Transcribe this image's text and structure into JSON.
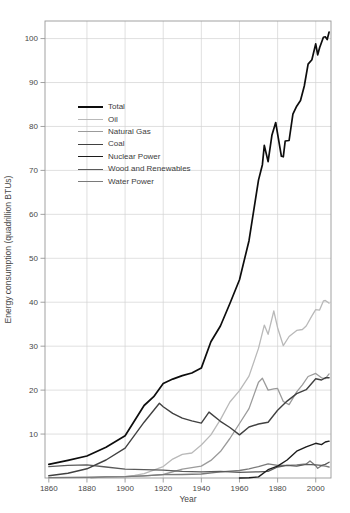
{
  "figure": {
    "background": "#ffffff",
    "text_color": "#474747",
    "grid_color": "#d2d2d2",
    "axis_color": "#979797"
  },
  "chart_data": {
    "type": "line",
    "title": "",
    "xlabel": "Year",
    "ylabel": "Energy consumption (quadrillion BTUs)",
    "xlim": [
      1858,
      2008
    ],
    "ylim": [
      0,
      104
    ],
    "xticks": [
      1860,
      1880,
      1900,
      1920,
      1940,
      1960,
      1980,
      2000
    ],
    "yticks": [
      10,
      20,
      30,
      40,
      50,
      60,
      70,
      80,
      90,
      100
    ],
    "grid": true,
    "legend_position": "upper-left-inside",
    "series": [
      {
        "name": "Total",
        "color": "#0d0d0d",
        "width": 1.7,
        "points": [
          [
            1860,
            3.1
          ],
          [
            1870,
            4.0
          ],
          [
            1880,
            5.0
          ],
          [
            1890,
            7.0
          ],
          [
            1900,
            9.6
          ],
          [
            1910,
            16.5
          ],
          [
            1915,
            18.5
          ],
          [
            1920,
            21.5
          ],
          [
            1925,
            22.5
          ],
          [
            1930,
            23.3
          ],
          [
            1935,
            23.9
          ],
          [
            1940,
            25.0
          ],
          [
            1945,
            31.0
          ],
          [
            1950,
            34.6
          ],
          [
            1955,
            39.7
          ],
          [
            1960,
            45.1
          ],
          [
            1965,
            54.0
          ],
          [
            1970,
            67.8
          ],
          [
            1972,
            71.3
          ],
          [
            1973,
            75.7
          ],
          [
            1975,
            72.0
          ],
          [
            1977,
            78.0
          ],
          [
            1979,
            80.9
          ],
          [
            1980,
            78.3
          ],
          [
            1982,
            73.2
          ],
          [
            1983,
            73.1
          ],
          [
            1984,
            76.7
          ],
          [
            1986,
            76.8
          ],
          [
            1988,
            82.8
          ],
          [
            1990,
            84.6
          ],
          [
            1992,
            85.9
          ],
          [
            1994,
            89.2
          ],
          [
            1996,
            94.2
          ],
          [
            1998,
            95.2
          ],
          [
            2000,
            98.8
          ],
          [
            2001,
            96.3
          ],
          [
            2002,
            97.9
          ],
          [
            2004,
            100.3
          ],
          [
            2005,
            100.4
          ],
          [
            2006,
            99.8
          ],
          [
            2007,
            101.5
          ]
        ]
      },
      {
        "name": "Oil",
        "color": "#b9b9b9",
        "width": 1.3,
        "points": [
          [
            1860,
            0.1
          ],
          [
            1880,
            0.2
          ],
          [
            1900,
            0.3
          ],
          [
            1905,
            0.6
          ],
          [
            1910,
            1.0
          ],
          [
            1920,
            2.6
          ],
          [
            1925,
            4.3
          ],
          [
            1930,
            5.4
          ],
          [
            1935,
            5.7
          ],
          [
            1940,
            7.5
          ],
          [
            1945,
            9.8
          ],
          [
            1950,
            13.3
          ],
          [
            1955,
            17.3
          ],
          [
            1960,
            19.9
          ],
          [
            1965,
            23.2
          ],
          [
            1970,
            29.5
          ],
          [
            1973,
            34.8
          ],
          [
            1975,
            32.7
          ],
          [
            1978,
            38.0
          ],
          [
            1980,
            34.2
          ],
          [
            1983,
            30.1
          ],
          [
            1986,
            32.2
          ],
          [
            1990,
            33.6
          ],
          [
            1993,
            33.8
          ],
          [
            1995,
            34.6
          ],
          [
            1998,
            36.9
          ],
          [
            2000,
            38.3
          ],
          [
            2002,
            38.2
          ],
          [
            2004,
            40.3
          ],
          [
            2005,
            40.4
          ],
          [
            2007,
            39.8
          ]
        ]
      },
      {
        "name": "Natural Gas",
        "color": "#9b9b9b",
        "width": 1.3,
        "points": [
          [
            1882,
            0.05
          ],
          [
            1890,
            0.25
          ],
          [
            1900,
            0.3
          ],
          [
            1910,
            0.5
          ],
          [
            1920,
            0.8
          ],
          [
            1930,
            2.0
          ],
          [
            1940,
            2.7
          ],
          [
            1945,
            4.0
          ],
          [
            1950,
            6.0
          ],
          [
            1955,
            9.0
          ],
          [
            1960,
            12.4
          ],
          [
            1965,
            15.8
          ],
          [
            1970,
            21.8
          ],
          [
            1972,
            22.7
          ],
          [
            1975,
            20.0
          ],
          [
            1978,
            20.3
          ],
          [
            1980,
            20.4
          ],
          [
            1983,
            17.4
          ],
          [
            1986,
            16.7
          ],
          [
            1990,
            19.6
          ],
          [
            1993,
            21.2
          ],
          [
            1996,
            23.1
          ],
          [
            2000,
            23.8
          ],
          [
            2003,
            22.8
          ],
          [
            2005,
            22.6
          ],
          [
            2007,
            23.7
          ]
        ]
      },
      {
        "name": "Coal",
        "color": "#414141",
        "width": 1.4,
        "points": [
          [
            1860,
            0.5
          ],
          [
            1870,
            1.1
          ],
          [
            1880,
            2.1
          ],
          [
            1890,
            4.1
          ],
          [
            1900,
            6.8
          ],
          [
            1910,
            12.7
          ],
          [
            1918,
            17.0
          ],
          [
            1920,
            16.2
          ],
          [
            1925,
            14.7
          ],
          [
            1930,
            13.6
          ],
          [
            1935,
            13.0
          ],
          [
            1940,
            12.5
          ],
          [
            1944,
            15.0
          ],
          [
            1950,
            12.9
          ],
          [
            1955,
            11.5
          ],
          [
            1960,
            9.8
          ],
          [
            1965,
            11.6
          ],
          [
            1970,
            12.3
          ],
          [
            1975,
            12.7
          ],
          [
            1980,
            15.4
          ],
          [
            1985,
            17.5
          ],
          [
            1990,
            19.2
          ],
          [
            1995,
            20.1
          ],
          [
            2000,
            22.6
          ],
          [
            2003,
            22.3
          ],
          [
            2005,
            22.8
          ],
          [
            2007,
            22.8
          ]
        ]
      },
      {
        "name": "Nuclear Power",
        "color": "#1c1c1c",
        "width": 1.4,
        "points": [
          [
            1960,
            0.01
          ],
          [
            1965,
            0.04
          ],
          [
            1970,
            0.24
          ],
          [
            1975,
            1.9
          ],
          [
            1980,
            2.7
          ],
          [
            1985,
            4.1
          ],
          [
            1990,
            6.1
          ],
          [
            1995,
            7.1
          ],
          [
            2000,
            7.9
          ],
          [
            2003,
            7.6
          ],
          [
            2005,
            8.2
          ],
          [
            2007,
            8.4
          ]
        ]
      },
      {
        "name": "Wood and Renewables",
        "color": "#5a5a5a",
        "width": 1.3,
        "points": [
          [
            1860,
            2.6
          ],
          [
            1870,
            2.9
          ],
          [
            1880,
            3.0
          ],
          [
            1890,
            2.5
          ],
          [
            1900,
            2.0
          ],
          [
            1910,
            1.9
          ],
          [
            1920,
            1.8
          ],
          [
            1930,
            1.5
          ],
          [
            1940,
            1.4
          ],
          [
            1950,
            1.5
          ],
          [
            1960,
            1.3
          ],
          [
            1970,
            1.4
          ],
          [
            1975,
            1.5
          ],
          [
            1980,
            2.5
          ],
          [
            1985,
            2.9
          ],
          [
            1990,
            2.7
          ],
          [
            1995,
            3.1
          ],
          [
            2000,
            3.0
          ],
          [
            2003,
            2.9
          ],
          [
            2005,
            3.1
          ],
          [
            2007,
            3.6
          ]
        ]
      },
      {
        "name": "Water Power",
        "color": "#7a7a7a",
        "width": 1.3,
        "points": [
          [
            1860,
            0.1
          ],
          [
            1880,
            0.15
          ],
          [
            1890,
            0.25
          ],
          [
            1900,
            0.3
          ],
          [
            1910,
            0.5
          ],
          [
            1920,
            0.76
          ],
          [
            1930,
            0.8
          ],
          [
            1940,
            0.9
          ],
          [
            1950,
            1.4
          ],
          [
            1960,
            1.7
          ],
          [
            1965,
            2.1
          ],
          [
            1970,
            2.6
          ],
          [
            1975,
            3.2
          ],
          [
            1980,
            2.9
          ],
          [
            1985,
            2.9
          ],
          [
            1990,
            3.0
          ],
          [
            1995,
            3.2
          ],
          [
            1997,
            3.9
          ],
          [
            2000,
            2.8
          ],
          [
            2001,
            2.2
          ],
          [
            2003,
            2.8
          ],
          [
            2005,
            2.7
          ],
          [
            2007,
            2.5
          ]
        ]
      }
    ]
  }
}
